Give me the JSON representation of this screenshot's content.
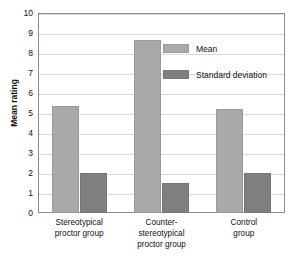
{
  "chart_data": {
    "type": "bar",
    "title": "",
    "xlabel": "",
    "ylabel": "Mean rating",
    "ylim": [
      0,
      10
    ],
    "ytick_step": 1,
    "yticks": [
      "10",
      "9",
      "8",
      "7",
      "6",
      "5",
      "4",
      "3",
      "2",
      "1",
      "0"
    ],
    "grid": true,
    "legend_position": "inside-top-right",
    "categories": [
      "Stereotypical\nproctor group",
      "Counter-\nstereotypical\nproctor group",
      "Control\ngroup"
    ],
    "category_lines": [
      [
        "Stereotypical",
        "proctor group"
      ],
      [
        "Counter-",
        "stereotypical",
        "proctor group"
      ],
      [
        "Control",
        "group"
      ]
    ],
    "series": [
      {
        "name": "Mean",
        "color": "#a9a9a9",
        "values": [
          5.35,
          8.65,
          5.2
        ]
      },
      {
        "name": "Standard deviation",
        "color": "#7f7f7f",
        "values": [
          2.0,
          1.5,
          2.0
        ]
      }
    ]
  },
  "legend": {
    "items": [
      {
        "label": "Mean",
        "color": "#a9a9a9"
      },
      {
        "label": "Standard deviation",
        "color": "#7f7f7f"
      }
    ]
  },
  "colors": {
    "mean_bar": "#a9a9a9",
    "sd_bar": "#7f7f7f",
    "gridline": "#d9d9d9",
    "axis": "#8c8c8c",
    "text": "#111111",
    "background": "#ffffff"
  }
}
